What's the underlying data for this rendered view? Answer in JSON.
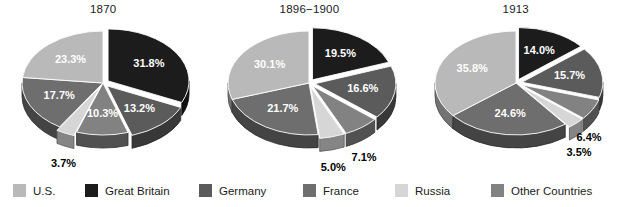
{
  "chart_data": [
    {
      "type": "pie",
      "title": "1870",
      "categories": [
        "Great Britain",
        "Germany",
        "Other Countries",
        "Russia",
        "France",
        "U.S."
      ],
      "values": [
        31.8,
        13.2,
        10.3,
        3.7,
        17.7,
        23.3
      ],
      "labels": [
        "31.8%",
        "13.2%",
        "10.3%",
        "3.7%",
        "17.7%",
        "23.3%"
      ],
      "label_position": [
        "inside",
        "inside",
        "inside",
        "outside",
        "inside",
        "inside"
      ],
      "exploded": [
        true,
        true,
        false,
        true,
        false,
        false
      ],
      "legend_position": "bottom",
      "grid": false
    },
    {
      "type": "pie",
      "title": "1896−1900",
      "categories": [
        "Great Britain",
        "Germany",
        "Other Countries",
        "Russia",
        "France",
        "U.S."
      ],
      "values": [
        19.5,
        16.6,
        7.1,
        5.0,
        21.7,
        30.1
      ],
      "labels": [
        "19.5%",
        "16.6%",
        "7.1%",
        "5.0%",
        "21.7%",
        "30.1%"
      ],
      "label_position": [
        "inside",
        "inside",
        "outside",
        "outside",
        "inside",
        "inside"
      ],
      "exploded": [
        true,
        true,
        true,
        true,
        false,
        false
      ],
      "legend_position": "bottom",
      "grid": false
    },
    {
      "type": "pie",
      "title": "1913",
      "categories": [
        "Great Britain",
        "Germany",
        "Other Countries",
        "Russia",
        "France",
        "U.S."
      ],
      "values": [
        14.0,
        15.7,
        6.4,
        3.5,
        24.6,
        35.8
      ],
      "labels": [
        "14.0%",
        "15.7%",
        "6.4%",
        "3.5%",
        "24.6%",
        "35.8%"
      ],
      "label_position": [
        "inside",
        "inside",
        "outside",
        "outside",
        "inside",
        "inside"
      ],
      "exploded": [
        true,
        true,
        true,
        true,
        false,
        false
      ],
      "legend_position": "bottom",
      "grid": false
    }
  ],
  "legend": {
    "items": [
      {
        "label": "U.S.",
        "color": "#b9b9b9"
      },
      {
        "label": "Great Britain",
        "color": "#1c1c1c"
      },
      {
        "label": "Germany",
        "color": "#5b5b5b"
      },
      {
        "label": "France",
        "color": "#6e6e6e"
      },
      {
        "label": "Russia",
        "color": "#d6d6d6"
      },
      {
        "label": "Other Countries",
        "color": "#828282"
      }
    ]
  },
  "colors": {
    "U.S.": "#b9b9b9",
    "Great Britain": "#1c1c1c",
    "Germany": "#5b5b5b",
    "France": "#6e6e6e",
    "Russia": "#d6d6d6",
    "Other Countries": "#828282",
    "background": "#ffffff",
    "text": "#1b1b1b",
    "label_inside": "#ffffff",
    "label_outside": "#000000"
  }
}
